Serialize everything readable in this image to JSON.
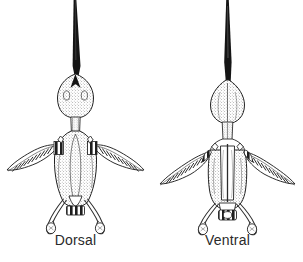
{
  "figure": {
    "background_color": "#ffffff",
    "ink_color": "#1a1a1a",
    "stipple_color": "#555555",
    "views": [
      {
        "id": "dorsal",
        "label": "Dorsal",
        "position": "left",
        "parts": [
          "beak",
          "skull",
          "neck",
          "shoulder-girdle",
          "back",
          "left-wing",
          "right-wing",
          "tail",
          "left-leg",
          "right-leg",
          "left-foot",
          "right-foot"
        ]
      },
      {
        "id": "ventral",
        "label": "Ventral",
        "position": "right",
        "parts": [
          "beak",
          "skull",
          "neck",
          "furcula",
          "sternum-keel",
          "breast",
          "left-wing",
          "right-wing",
          "pelvis",
          "left-leg",
          "right-leg",
          "left-foot",
          "right-foot"
        ]
      }
    ]
  }
}
